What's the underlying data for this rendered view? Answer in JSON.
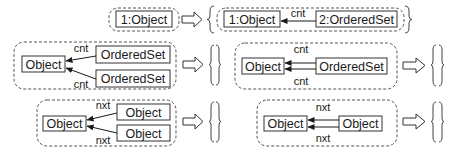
{
  "colors": {
    "stroke": "#333333",
    "dashed": "#555555",
    "background": "#ffffff"
  },
  "rules": [
    {
      "id": "rule-1",
      "lhs": {
        "nodes": [
          "1:Object"
        ]
      },
      "rhs": {
        "nodes": [
          "1:Object",
          "2:OrderedSet"
        ],
        "edges": [
          {
            "from": "2:OrderedSet",
            "to": "1:Object",
            "label": "cnt"
          }
        ]
      }
    },
    {
      "id": "rule-2",
      "lhs": {
        "nodes": [
          "Object",
          "OrderedSet",
          "OrderedSet"
        ],
        "edges": [
          {
            "from": "OrderedSet",
            "to": "Object",
            "label": "cnt"
          },
          {
            "from": "OrderedSet",
            "to": "Object",
            "label": "cnt"
          }
        ]
      },
      "rhs": {
        "empty": true
      }
    },
    {
      "id": "rule-3",
      "lhs": {
        "nodes": [
          "Object",
          "OrderedSet"
        ],
        "edges": [
          {
            "from": "OrderedSet",
            "to": "Object",
            "label": "cnt"
          },
          {
            "from": "OrderedSet",
            "to": "Object",
            "label": "cnt"
          }
        ]
      },
      "rhs": {
        "empty": true
      }
    },
    {
      "id": "rule-4",
      "lhs": {
        "nodes": [
          "Object",
          "Object",
          "Object"
        ],
        "edges": [
          {
            "from": "Object",
            "to": "Object",
            "label": "nxt"
          },
          {
            "from": "Object",
            "to": "Object",
            "label": "nxt"
          }
        ]
      },
      "rhs": {
        "empty": true
      }
    },
    {
      "id": "rule-5",
      "lhs": {
        "nodes": [
          "Object",
          "Object"
        ],
        "edges": [
          {
            "from": "Object",
            "to": "Object",
            "label": "nxt"
          },
          {
            "from": "Object",
            "to": "Object",
            "label": "nxt"
          }
        ]
      },
      "rhs": {
        "empty": true
      }
    }
  ],
  "labels": {
    "r1_lhs_obj": "1:Object",
    "r1_rhs_obj": "1:Object",
    "r1_rhs_set": "2:OrderedSet",
    "r1_edge": "cnt",
    "r2_obj": "Object",
    "r2_set1": "OrderedSet",
    "r2_set2": "OrderedSet",
    "r2_edge1": "cnt",
    "r2_edge2": "cnt",
    "r3_obj": "Object",
    "r3_set": "OrderedSet",
    "r3_edge1": "cnt",
    "r3_edge2": "cnt",
    "r4_obj": "Object",
    "r4_obj1": "Object",
    "r4_obj2": "Object",
    "r4_edge1": "nxt",
    "r4_edge2": "nxt",
    "r5_obj": "Object",
    "r5_obj2": "Object",
    "r5_edge1": "nxt",
    "r5_edge2": "nxt"
  }
}
